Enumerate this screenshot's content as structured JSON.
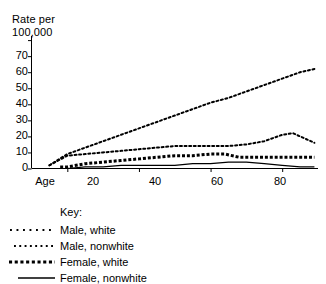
{
  "chart_data": {
    "type": "line",
    "title": "",
    "xlabel": "Age",
    "ylabel": "Rate per\n100,000",
    "ylabel_line1": "Rate per",
    "ylabel_line2": "100,000",
    "xlim": [
      10,
      90
    ],
    "ylim": [
      0,
      80
    ],
    "grid": false,
    "legend_position": "below-left",
    "legend_title": "Key:",
    "x_tick_labels": [
      "20",
      "40",
      "60",
      "80"
    ],
    "x_ticks": [
      20,
      40,
      60,
      80
    ],
    "y_tick_labels": [
      "0",
      "10",
      "20",
      "30",
      "40",
      "50",
      "60",
      "70"
    ],
    "y_ticks": [
      0,
      10,
      20,
      30,
      40,
      50,
      60,
      70
    ],
    "y_unlabeled_ticks": [
      80
    ],
    "series": [
      {
        "name": "Male, white",
        "style": "dotted-fine",
        "color": "#000000",
        "x": [
          15,
          20,
          25,
          30,
          35,
          40,
          45,
          50,
          55,
          60,
          65,
          70,
          75,
          80,
          85,
          89
        ],
        "values": [
          2,
          9,
          13,
          17,
          21,
          25,
          29,
          33,
          37,
          41,
          44,
          48,
          52,
          56,
          60,
          62
        ]
      },
      {
        "name": "Male, nonwhite",
        "style": "dotted-fine",
        "color": "#000000",
        "x": [
          15,
          20,
          25,
          30,
          35,
          40,
          45,
          50,
          55,
          60,
          65,
          70,
          75,
          80,
          83,
          86,
          89
        ],
        "values": [
          2,
          8,
          9,
          10,
          11,
          12,
          13,
          14,
          14,
          14,
          14,
          15,
          17,
          21,
          22,
          19,
          16
        ]
      },
      {
        "name": "Female, white",
        "style": "dotted-bold",
        "color": "#000000",
        "x": [
          18,
          20,
          25,
          30,
          35,
          40,
          45,
          50,
          55,
          60,
          64,
          68,
          72,
          76,
          80,
          85,
          89
        ],
        "values": [
          1,
          1,
          3,
          4,
          5,
          6,
          7,
          8,
          8,
          9,
          9,
          7,
          7,
          7,
          7,
          7,
          7
        ]
      },
      {
        "name": "Female, nonwhite",
        "style": "solid",
        "color": "#000000",
        "x": [
          15,
          20,
          25,
          30,
          35,
          40,
          45,
          50,
          55,
          60,
          65,
          70,
          75,
          80,
          85,
          89
        ],
        "values": [
          0,
          0,
          1,
          1,
          2,
          2,
          2,
          2,
          3,
          3,
          4,
          4,
          3,
          2,
          1,
          1
        ]
      }
    ]
  },
  "legend": {
    "title": "Key:",
    "items": [
      {
        "label": "Male, white",
        "style": "dotted-fine"
      },
      {
        "label": "Male, nonwhite",
        "style": "dotted-fine"
      },
      {
        "label": "Female, white",
        "style": "dotted-bold"
      },
      {
        "label": "Female, nonwhite",
        "style": "solid"
      }
    ]
  },
  "axes": {
    "y_title_line1": "Rate per",
    "y_title_line2": "100,000",
    "x_axis_name": "Age"
  }
}
